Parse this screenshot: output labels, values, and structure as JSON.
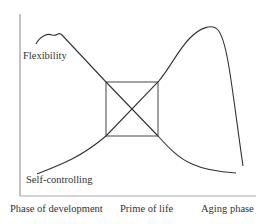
{
  "diagram": {
    "curves": {
      "flexibility": {
        "label": "Flexibility"
      },
      "self_controlling": {
        "label": "Self-controlling"
      }
    },
    "x_axis_labels": [
      "Phase of development",
      "Prime of life",
      "Aging phase"
    ],
    "colors": {
      "line": "#333333",
      "axis": "#888888"
    }
  }
}
